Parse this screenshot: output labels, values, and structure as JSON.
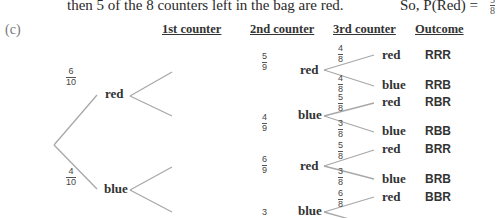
{
  "text": {
    "top_line": "then 5 of the 8 counters left in the bag are red.",
    "top_right_prefix": "So, P(Red)  =",
    "top_right_frac": {
      "num": "5",
      "den": "8"
    },
    "part_label": "(c)"
  },
  "headers": {
    "first": "1st counter",
    "second": "2nd counter",
    "third": "3rd counter",
    "outcome": "Outcome"
  },
  "tree": {
    "level1": [
      {
        "label": "red",
        "prob": {
          "num": "6",
          "den": "10"
        }
      },
      {
        "label": "blue",
        "prob": {
          "num": "4",
          "den": "10"
        }
      }
    ],
    "level2": [
      {
        "label": "red",
        "prob": {
          "num": "5",
          "den": "9"
        }
      },
      {
        "label": "blue",
        "prob": {
          "num": "4",
          "den": "9"
        }
      },
      {
        "label": "red",
        "prob": {
          "num": "6",
          "den": "9"
        }
      },
      {
        "label": "blue",
        "prob": {
          "num": "3",
          "den": ""
        }
      }
    ],
    "level3": [
      {
        "label": "red",
        "prob": {
          "num": "4",
          "den": "8"
        },
        "outcome": "RRR"
      },
      {
        "label": "blue",
        "prob": {
          "num": "4",
          "den": "8"
        },
        "outcome": "RRB"
      },
      {
        "label": "red",
        "prob": {
          "num": "5",
          "den": "8"
        },
        "outcome": "RBR"
      },
      {
        "label": "blue",
        "prob": {
          "num": "3",
          "den": "8"
        },
        "outcome": "RBB"
      },
      {
        "label": "red",
        "prob": {
          "num": "5",
          "den": "8"
        },
        "outcome": "BRR"
      },
      {
        "label": "blue",
        "prob": {
          "num": "3",
          "den": "8"
        },
        "outcome": "BRB"
      },
      {
        "label": "red",
        "prob": {
          "num": "6",
          "den": "8"
        },
        "outcome": "BBR"
      }
    ]
  }
}
